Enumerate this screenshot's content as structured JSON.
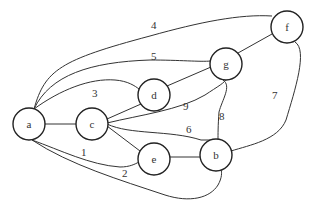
{
  "graph": {
    "nodes": [
      {
        "id": "a",
        "label": "a",
        "x": 29,
        "y": 124
      },
      {
        "id": "c",
        "label": "c",
        "x": 92,
        "y": 124
      },
      {
        "id": "d",
        "label": "d",
        "x": 154,
        "y": 95
      },
      {
        "id": "e",
        "label": "e",
        "x": 154,
        "y": 159
      },
      {
        "id": "b",
        "label": "b",
        "x": 216,
        "y": 155
      },
      {
        "id": "g",
        "label": "g",
        "x": 226,
        "y": 64
      },
      {
        "id": "f",
        "label": "f",
        "x": 287,
        "y": 27
      }
    ],
    "edges": [
      {
        "from": "a",
        "to": "f",
        "weight": "4"
      },
      {
        "from": "a",
        "to": "g",
        "weight": "5"
      },
      {
        "from": "a",
        "to": "d",
        "weight": "3"
      },
      {
        "from": "a",
        "to": "c",
        "weight": ""
      },
      {
        "from": "a",
        "to": "e",
        "weight": "1"
      },
      {
        "from": "a",
        "to": "b",
        "weight": "2"
      },
      {
        "from": "c",
        "to": "d",
        "weight": ""
      },
      {
        "from": "c",
        "to": "g",
        "weight": "9"
      },
      {
        "from": "c",
        "to": "b",
        "weight": "6"
      },
      {
        "from": "c",
        "to": "e",
        "weight": ""
      },
      {
        "from": "d",
        "to": "g",
        "weight": ""
      },
      {
        "from": "g",
        "to": "f",
        "weight": ""
      },
      {
        "from": "g",
        "to": "b",
        "weight": "8"
      },
      {
        "from": "e",
        "to": "b",
        "weight": ""
      },
      {
        "from": "f",
        "to": "b",
        "weight": "7"
      }
    ]
  },
  "labels": {
    "a": "a",
    "b": "b",
    "c": "c",
    "d": "d",
    "e": "e",
    "f": "f",
    "g": "g",
    "w1": "1",
    "w2": "2",
    "w3": "3",
    "w4": "4",
    "w5": "5",
    "w6": "6",
    "w7": "7",
    "w8": "8",
    "w9": "9"
  }
}
